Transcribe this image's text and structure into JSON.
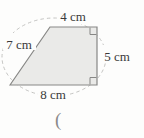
{
  "figure": {
    "type": "trapezoid-with-side-lengths",
    "labels": {
      "top": "4 cm",
      "left": "7 cm",
      "right": "5 cm",
      "bottom": "8 cm"
    },
    "right_angle_markers": [
      "top-right",
      "bottom-right"
    ],
    "annotation": "(",
    "colors": {
      "paper": "#fdfdfc",
      "shape_fill": "#eaeae8",
      "shape_outline": "#878785",
      "dashed_curve": "#bdbdbb",
      "label_text": "#3a3a3a",
      "annotation_text": "#8a8a8a"
    }
  }
}
